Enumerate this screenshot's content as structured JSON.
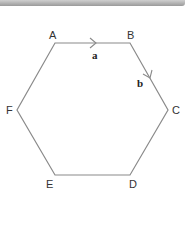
{
  "diagram": {
    "shape": "regular hexagon",
    "stroke_color": "#8a8a8a",
    "vertices": [
      {
        "label": "A",
        "x": 55,
        "y": 43
      },
      {
        "label": "B",
        "x": 130,
        "y": 43
      },
      {
        "label": "C",
        "x": 168,
        "y": 110
      },
      {
        "label": "D",
        "x": 130,
        "y": 175
      },
      {
        "label": "E",
        "x": 55,
        "y": 175
      },
      {
        "label": "F",
        "x": 17,
        "y": 110
      }
    ],
    "vectors": [
      {
        "label": "a",
        "from": "A",
        "to": "B"
      },
      {
        "label": "b",
        "from": "B",
        "to": "C"
      }
    ]
  }
}
